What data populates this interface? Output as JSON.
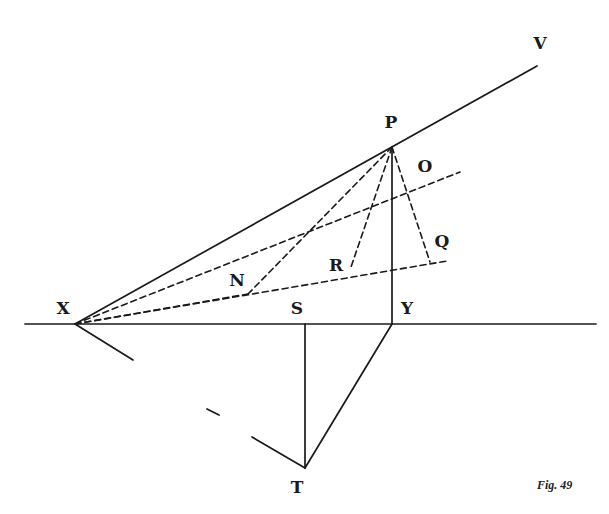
{
  "figure": {
    "caption": "Fig. 49",
    "labels": {
      "V": "V",
      "P": "P",
      "O": "O",
      "Q": "Q",
      "R": "R",
      "N": "N",
      "X": "X",
      "S": "S",
      "Y": "Y",
      "T": "T"
    },
    "points": {
      "X": [
        75,
        324
      ],
      "P": [
        392,
        147
      ],
      "V_end": [
        537,
        66
      ],
      "Y": [
        392,
        324
      ],
      "S": [
        305,
        324
      ],
      "T": [
        305,
        468
      ],
      "O_end": [
        460,
        172
      ],
      "Q": [
        430,
        262
      ],
      "Q_line_end": [
        447,
        261
      ],
      "R": [
        350,
        270
      ],
      "N": [
        248,
        294
      ]
    },
    "colors": {
      "ink": "#1a1a1a",
      "background": "#ffffff"
    }
  }
}
